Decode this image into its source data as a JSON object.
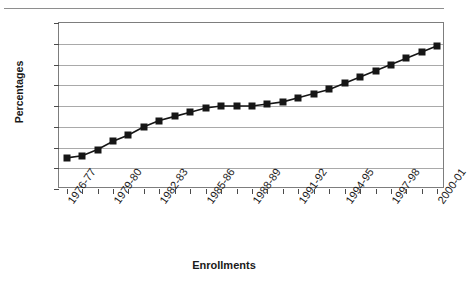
{
  "chart_data": {
    "type": "line",
    "title": "",
    "xlabel": "Enrollments",
    "ylabel": "Percentages",
    "ylim": [
      7,
      15
    ],
    "ytick_values": [
      15,
      14,
      13,
      12,
      11,
      10,
      9,
      8,
      7
    ],
    "grid": true,
    "legend": "none",
    "marker": "filled-square",
    "categories": [
      "1976-77",
      "1977-78",
      "1978-79",
      "1979-80",
      "1980-81",
      "1981-82",
      "1982-83",
      "1983-84",
      "1984-85",
      "1985-86",
      "1986-87",
      "1987-88",
      "1988-89",
      "1989-90",
      "1990-91",
      "1991-92",
      "1992-93",
      "1993-94",
      "1994-95",
      "1995-96",
      "1996-97",
      "1997-98",
      "1998-99",
      "1999-2000",
      "2000-01"
    ],
    "labeled_categories": [
      "1976-77",
      "1979-80",
      "1982-83",
      "1985-86",
      "1988-89",
      "1991-92",
      "1994-95",
      "1997-98",
      "2000-01"
    ],
    "label_interval": 3,
    "values": [
      8.5,
      8.6,
      8.9,
      9.3,
      9.6,
      10.0,
      10.3,
      10.5,
      10.7,
      10.9,
      11.0,
      11.0,
      11.0,
      11.1,
      11.2,
      11.4,
      11.6,
      11.8,
      12.1,
      12.4,
      12.7,
      13.0,
      13.3,
      13.6,
      13.9
    ]
  },
  "chart": {
    "clipped_title": "",
    "series_color": "#161616",
    "grid_color": "#a9a9a9",
    "frame_color": "#7d7d7d"
  }
}
